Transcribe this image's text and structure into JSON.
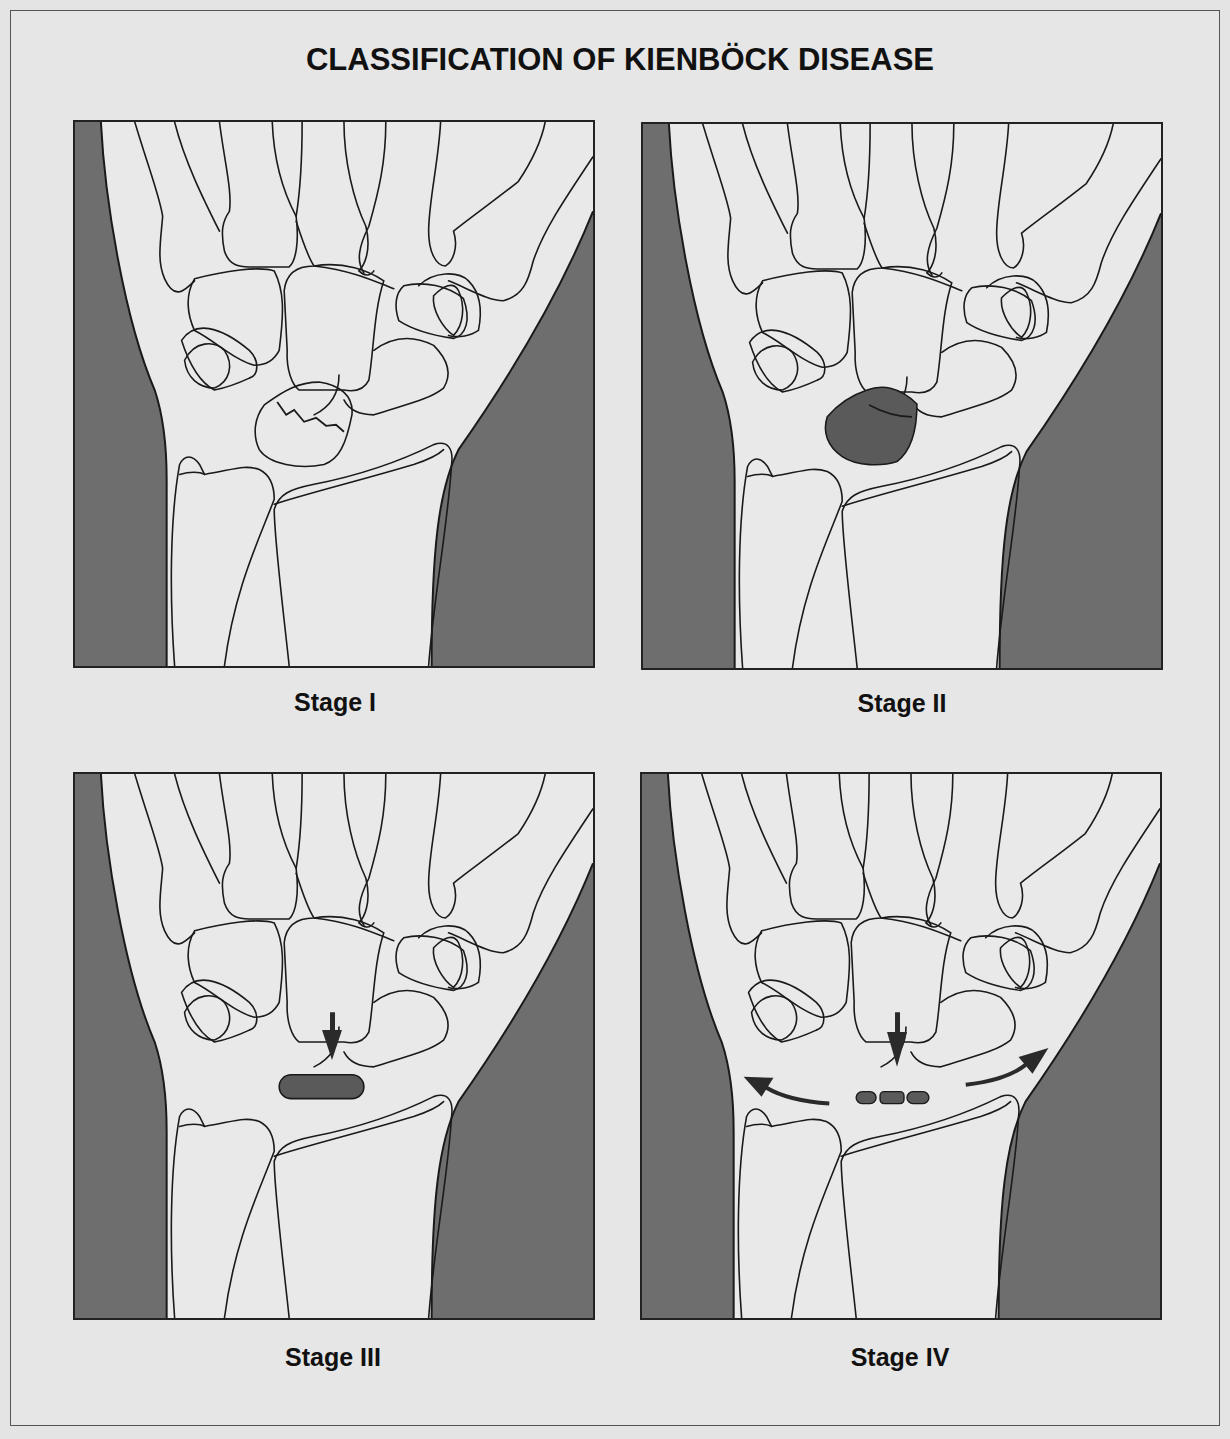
{
  "figure": {
    "title": "CLASSIFICATION OF KIENBÖCK DISEASE",
    "colors": {
      "background": "#e6e6e6",
      "soft_tissue_shadow": "#6e6e6e",
      "bone_fill": "#ececec",
      "outline": "#1a1a1a",
      "lunate_lesion": "#5a5a5a"
    },
    "panels": [
      {
        "id": "stage-1",
        "label": "Stage I",
        "lunate_finding": "fracture-line"
      },
      {
        "id": "stage-2",
        "label": "Stage II",
        "lunate_finding": "sclerosis"
      },
      {
        "id": "stage-3",
        "label": "Stage III",
        "lunate_finding": "collapse",
        "annotations": [
          "capitate-migration-arrow"
        ]
      },
      {
        "id": "stage-4",
        "label": "Stage IV",
        "lunate_finding": "fragmentation",
        "annotations": [
          "capitate-migration-arrow",
          "radial-widening-arrow",
          "ulnar-widening-arrow"
        ]
      }
    ]
  }
}
